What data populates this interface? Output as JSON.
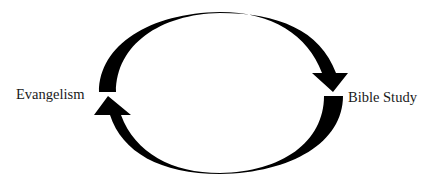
{
  "diagram": {
    "type": "cycle",
    "nodes": [
      {
        "id": "evangelism",
        "label": "Evangelism",
        "position": "left"
      },
      {
        "id": "bible_study",
        "label": "Bible Study",
        "position": "right"
      }
    ],
    "edges": [
      {
        "from": "evangelism",
        "to": "bible_study",
        "path": "top-arc",
        "arrow": "clockwise"
      },
      {
        "from": "bible_study",
        "to": "evangelism",
        "path": "bottom-arc",
        "arrow": "clockwise"
      }
    ],
    "colors": {
      "arrow": "#000000",
      "text": "#1a1a1a",
      "background": "#ffffff"
    }
  }
}
